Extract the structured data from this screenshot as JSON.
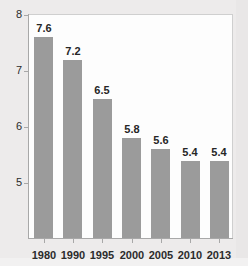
{
  "chart_data": {
    "type": "bar",
    "title": "",
    "subtitle": "",
    "xlabel": "",
    "ylabel": "",
    "categories": [
      "1980",
      "1990",
      "1995",
      "2000",
      "2005",
      "2010",
      "2013"
    ],
    "values": [
      7.6,
      7.2,
      6.5,
      5.8,
      5.6,
      5.4,
      5.4
    ],
    "value_labels": [
      "7.6",
      "7.2",
      "6.5",
      "5.8",
      "5.6",
      "5.4",
      "5.4"
    ],
    "y_ticks": [
      5,
      6,
      7,
      8
    ],
    "y_tick_labels": [
      "5",
      "6",
      "7",
      "8"
    ],
    "ylim": [
      4.2,
      8.0
    ],
    "grid": false,
    "legend": null,
    "legend_position": "none",
    "bar_color": "#9b9b9b",
    "axis_color": "#a8a8a8",
    "plot_background": "#fdfdfd",
    "figure_background": "#edebeb",
    "label_color": "#262626"
  },
  "axis": {
    "y": {
      "ticks": [
        {
          "label": "8"
        },
        {
          "label": "7"
        },
        {
          "label": "6"
        },
        {
          "label": "5"
        }
      ]
    },
    "x": {
      "ticks": [
        {
          "label": "1980"
        },
        {
          "label": "1990"
        },
        {
          "label": "1995"
        },
        {
          "label": "2000"
        },
        {
          "label": "2005"
        },
        {
          "label": "2010"
        },
        {
          "label": "2013"
        }
      ]
    }
  },
  "bars": [
    {
      "category": "1980",
      "value": 7.6,
      "label": "7.6"
    },
    {
      "category": "1990",
      "value": 7.2,
      "label": "7.2"
    },
    {
      "category": "1995",
      "value": 6.5,
      "label": "6.5"
    },
    {
      "category": "2000",
      "value": 5.8,
      "label": "5.8"
    },
    {
      "category": "2005",
      "value": 5.6,
      "label": "5.6"
    },
    {
      "category": "2010",
      "value": 5.4,
      "label": "5.4"
    },
    {
      "category": "2013",
      "value": 5.4,
      "label": "5.4"
    }
  ]
}
